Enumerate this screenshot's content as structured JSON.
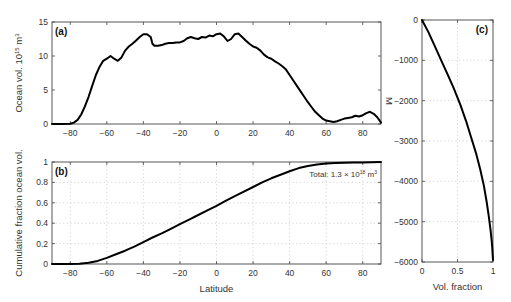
{
  "chart_data": [
    {
      "id": "a",
      "type": "line",
      "panel_label": "(a)",
      "title": "",
      "xlabel": "",
      "ylabel": "Ocean vol. 10",
      "ylabel_exp": "15",
      "ylabel_unit": " m",
      "ylabel_unit_exp": "3",
      "xlim": [
        -90,
        90
      ],
      "ylim": [
        0,
        15
      ],
      "xticks": [
        -80,
        -60,
        -40,
        -20,
        0,
        20,
        40,
        60,
        80
      ],
      "xtick_labels": [
        "−80",
        "−60",
        "−40",
        "−20",
        "0",
        "20",
        "40",
        "60",
        "80"
      ],
      "yticks": [
        0,
        5,
        10,
        15
      ],
      "ytick_labels": [
        "0",
        "5",
        "10",
        "15"
      ],
      "grid": false,
      "series": [
        {
          "name": "Ocean volume per latitude",
          "x": [
            -90,
            -85,
            -80,
            -78,
            -76,
            -74,
            -72,
            -70,
            -68,
            -66,
            -64,
            -62,
            -60,
            -58,
            -56,
            -54,
            -52,
            -50,
            -48,
            -46,
            -44,
            -42,
            -40,
            -38,
            -36,
            -35,
            -34,
            -32,
            -30,
            -28,
            -26,
            -24,
            -22,
            -20,
            -18,
            -16,
            -14,
            -12,
            -10,
            -8,
            -6,
            -4,
            -2,
            0,
            2,
            4,
            6,
            8,
            10,
            12,
            14,
            16,
            18,
            20,
            22,
            24,
            26,
            28,
            30,
            32,
            34,
            36,
            38,
            40,
            42,
            44,
            46,
            48,
            50,
            52,
            54,
            56,
            58,
            60,
            62,
            64,
            66,
            68,
            70,
            72,
            74,
            76,
            78,
            80,
            82,
            84,
            86,
            88,
            90
          ],
          "y": [
            0.0,
            0.0,
            0.05,
            0.2,
            0.6,
            1.4,
            2.6,
            4.0,
            5.6,
            7.2,
            8.4,
            9.3,
            9.6,
            10.0,
            9.6,
            9.3,
            9.8,
            10.8,
            11.4,
            11.8,
            12.3,
            12.8,
            13.2,
            13.2,
            12.8,
            11.8,
            11.5,
            11.5,
            11.6,
            11.8,
            11.9,
            11.9,
            12.0,
            12.0,
            12.2,
            12.6,
            12.8,
            12.6,
            12.5,
            12.8,
            12.7,
            13.0,
            12.9,
            13.2,
            13.3,
            12.9,
            12.2,
            12.5,
            13.2,
            13.3,
            12.8,
            12.3,
            11.8,
            11.4,
            11.2,
            10.8,
            10.2,
            9.8,
            9.6,
            9.2,
            8.9,
            8.5,
            8.0,
            7.2,
            6.4,
            5.6,
            4.8,
            4.0,
            3.2,
            2.5,
            1.8,
            1.3,
            0.8,
            0.5,
            0.4,
            0.3,
            0.4,
            0.6,
            0.8,
            0.9,
            1.0,
            1.2,
            1.1,
            1.3,
            1.6,
            1.8,
            1.5,
            1.0,
            0.2
          ]
        }
      ]
    },
    {
      "id": "b",
      "type": "line",
      "panel_label": "(b)",
      "title": "",
      "xlabel": "Latitude",
      "ylabel": "Cumulative fraction ocean vol.",
      "xlim": [
        -90,
        90
      ],
      "ylim": [
        0,
        1
      ],
      "xticks": [
        -80,
        -60,
        -40,
        -20,
        0,
        20,
        40,
        60,
        80
      ],
      "xtick_labels": [
        "−80",
        "−60",
        "−40",
        "−20",
        "0",
        "20",
        "40",
        "60",
        "80"
      ],
      "yticks": [
        0,
        0.2,
        0.4,
        0.6,
        0.8,
        1
      ],
      "ytick_labels": [
        "0",
        "0.2",
        "0.4",
        "0.6",
        "0.8",
        "1"
      ],
      "grid": true,
      "annotation": {
        "prefix": "Total: 1.3 × 10",
        "exp": "18",
        "unit": " m",
        "unit_exp": "3",
        "position": "top-right"
      },
      "series": [
        {
          "name": "Cumulative fraction",
          "x": [
            -90,
            -80,
            -75,
            -70,
            -65,
            -60,
            -55,
            -50,
            -45,
            -40,
            -35,
            -30,
            -25,
            -20,
            -15,
            -10,
            -5,
            0,
            5,
            10,
            15,
            20,
            25,
            30,
            35,
            40,
            45,
            50,
            55,
            60,
            65,
            70,
            75,
            80,
            85,
            90
          ],
          "y": [
            0.0,
            0.0,
            0.003,
            0.012,
            0.03,
            0.06,
            0.095,
            0.13,
            0.17,
            0.215,
            0.26,
            0.3,
            0.345,
            0.39,
            0.435,
            0.48,
            0.525,
            0.57,
            0.62,
            0.665,
            0.71,
            0.755,
            0.8,
            0.84,
            0.875,
            0.91,
            0.94,
            0.96,
            0.975,
            0.985,
            0.99,
            0.992,
            0.994,
            0.996,
            0.998,
            1.0
          ]
        }
      ]
    },
    {
      "id": "c",
      "type": "line",
      "panel_label": "(c)",
      "title": "",
      "xlabel": "Vol. fraction",
      "ylabel": "M",
      "xlim": [
        0,
        1
      ],
      "ylim": [
        -6000,
        0
      ],
      "xticks": [
        0,
        0.5,
        1
      ],
      "xtick_labels": [
        "0",
        "0.5",
        "1"
      ],
      "yticks": [
        0,
        -1000,
        -2000,
        -3000,
        -4000,
        -5000,
        -6000
      ],
      "ytick_labels": [
        "0",
        "−1000",
        "−2000",
        "−3000",
        "−4000",
        "−5000",
        "−6000"
      ],
      "grid": true,
      "series": [
        {
          "name": "Volume fraction above depth",
          "x": [
            0.0,
            0.09,
            0.18,
            0.27,
            0.36,
            0.45,
            0.54,
            0.62,
            0.69,
            0.76,
            0.82,
            0.87,
            0.91,
            0.94,
            0.965,
            0.98,
            0.99,
            0.995,
            1.0
          ],
          "y": [
            0,
            -300,
            -650,
            -1000,
            -1350,
            -1700,
            -2100,
            -2500,
            -2900,
            -3300,
            -3700,
            -4100,
            -4500,
            -4850,
            -5200,
            -5450,
            -5650,
            -5800,
            -5950
          ]
        }
      ]
    }
  ]
}
